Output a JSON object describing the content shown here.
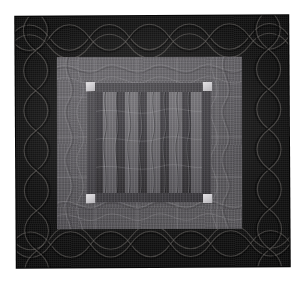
{
  "image": {
    "subject": "Amish Bars quilt",
    "caption": "Photograph of a dark Amish-style Bars quilt on a white background",
    "background_color": "#ffffff"
  },
  "quilt": {
    "outer_border": {
      "name": "outer border",
      "color": "#0a0a0a",
      "quilting_motif": "cable",
      "thread_color": "#6a6663"
    },
    "inner_border": {
      "name": "inner gray border",
      "color": "#58565a",
      "quilting_motif": "feather vine",
      "thread_color": "#9a979c"
    },
    "sashing_frame": {
      "name": "inner sashing frame",
      "color": "#3a383c"
    },
    "corner_squares": {
      "name": "corner squares",
      "color": "#cfcdd0",
      "count": "4",
      "positions": [
        "top-left",
        "top-right",
        "bottom-left",
        "bottom-right"
      ]
    },
    "center_field": {
      "name": "bars center field",
      "background_color": "#2c2a2e",
      "bar_light_color": "#5e5c61",
      "bar_dark_color": "#302e33",
      "quilting_motif": "vertical lines with wave",
      "bars": [
        {
          "tone": "dark",
          "width": 7
        },
        {
          "tone": "light",
          "width": 13
        },
        {
          "tone": "dark",
          "width": 9
        },
        {
          "tone": "light",
          "width": 13
        },
        {
          "tone": "dark",
          "width": 9
        },
        {
          "tone": "light",
          "width": 13
        },
        {
          "tone": "dark",
          "width": 9
        },
        {
          "tone": "light",
          "width": 13
        },
        {
          "tone": "dark",
          "width": 9
        },
        {
          "tone": "light",
          "width": 11
        }
      ]
    }
  }
}
